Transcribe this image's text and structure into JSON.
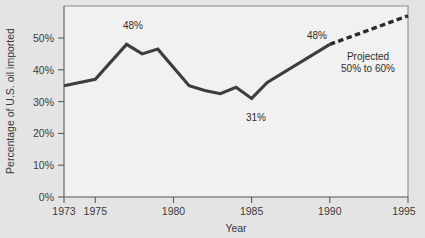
{
  "chart_data": {
    "type": "line",
    "title": "",
    "xlabel": "Year",
    "ylabel": "Percentage of U.S. oil imported",
    "xlim": [
      1973,
      1995
    ],
    "ylim": [
      0,
      60
    ],
    "grid": false,
    "legend_position": "none",
    "xticks": [
      1973,
      1975,
      1980,
      1985,
      1990,
      1995
    ],
    "xticklabels": [
      "1973",
      "1975",
      "1980",
      "1985",
      "1990",
      "1995"
    ],
    "yticks": [
      0,
      10,
      20,
      30,
      40,
      50
    ],
    "yticklabels": [
      "0%",
      "10%",
      "20%",
      "30%",
      "40%",
      "50%"
    ],
    "series": [
      {
        "name": "Actual",
        "style": "solid",
        "x": [
          1973,
          1975,
          1977,
          1978,
          1979,
          1981,
          1982,
          1983,
          1984,
          1985,
          1986,
          1990
        ],
        "values": [
          35,
          37,
          48,
          45,
          46.5,
          35,
          33.5,
          32.5,
          34.5,
          31,
          36,
          48
        ]
      },
      {
        "name": "Projected",
        "style": "dashed",
        "x": [
          1990,
          1995
        ],
        "values": [
          48,
          57
        ]
      }
    ],
    "annotations": [
      {
        "text": "48%",
        "x": 1977,
        "y": 48,
        "name": "peak-1977-label"
      },
      {
        "text": "31%",
        "x": 1985,
        "y": 31,
        "name": "low-1985-label"
      },
      {
        "text": "48%",
        "x": 1990,
        "y": 48,
        "name": "value-1990-label"
      },
      {
        "text": "Projected",
        "x": 1992,
        "y": 43,
        "name": "projected-label-line1"
      },
      {
        "text": "50% to 60%",
        "x": 1992,
        "y": 39,
        "name": "projected-label-line2"
      }
    ]
  },
  "axes": {
    "y_title": "Percentage of U.S. oil imported",
    "x_title": "Year",
    "y_tick_0": "0%",
    "y_tick_10": "10%",
    "y_tick_20": "20%",
    "y_tick_30": "30%",
    "y_tick_40": "40%",
    "y_tick_50": "50%",
    "x_tick_1973": "1973",
    "x_tick_1975": "1975",
    "x_tick_1980": "1980",
    "x_tick_1985": "1985",
    "x_tick_1990": "1990",
    "x_tick_1995": "1995"
  },
  "annotations": {
    "peak_1977": "48%",
    "low_1985": "31%",
    "value_1990": "48%",
    "projected_line1": "Projected",
    "projected_line2": "50% to 60%"
  },
  "colors": {
    "series_line": "#3d3d3d",
    "projection_line": "#2b2b2b",
    "plot_background": "#f1f1f1",
    "figure_background": "#e4e4e4",
    "axis": "#5a5a5a",
    "text": "#3a3a3a"
  }
}
